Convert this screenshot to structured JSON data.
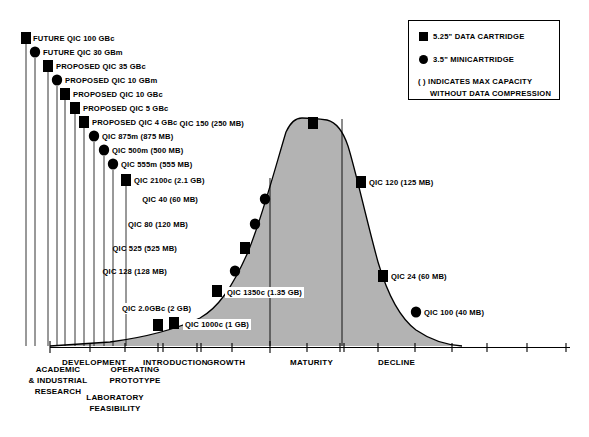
{
  "chart_data": {
    "type": "area",
    "xlabel": "",
    "ylabel": "",
    "grid": false,
    "legend_position": "top-right",
    "phases": [
      {
        "label": "DEVELOPMENT",
        "x": 62,
        "y": 358
      },
      {
        "label": "INTRODUCTION",
        "x": 143,
        "y": 358
      },
      {
        "label": "GROWTH",
        "x": 207,
        "y": 358
      },
      {
        "label": "MATURITY",
        "x": 290,
        "y": 358
      },
      {
        "label": "DECLINE",
        "x": 378,
        "y": 358
      }
    ],
    "sub_phases": [
      {
        "label": "ACADEMIC\n& INDUSTRIAL\nRESEARCH",
        "x": 12,
        "y": 370
      },
      {
        "label": "OPERATING\nPROTOTYPE",
        "x": 98,
        "y": 370
      },
      {
        "label": "LABORATORY\nFEASIBILITY",
        "x": 58,
        "y": 398
      }
    ],
    "curve_note": "Technology adoption S-curve / product life-cycle shaded area",
    "points": [
      {
        "name": "FUTURE QIC 100 GBc",
        "capacity": "100 GB",
        "marker": "square",
        "x": 26,
        "y": 38,
        "label": "FUTURE QIC 100 GBc",
        "lx": 33,
        "ly": 34
      },
      {
        "name": "FUTURE QIC 30 GBm",
        "capacity": "30 GB",
        "marker": "circle",
        "x": 35,
        "y": 52,
        "label": "FUTURE QIC 30 GBm",
        "lx": 43,
        "ly": 48
      },
      {
        "name": "PROPOSED QIC 35 GBc",
        "capacity": "35 GB",
        "marker": "square",
        "x": 48,
        "y": 66,
        "label": "PROPOSED QIC 35 GBc",
        "lx": 56,
        "ly": 62
      },
      {
        "name": "PROPOSED QIC 10 GBm",
        "capacity": "10 GB",
        "marker": "circle",
        "x": 57,
        "y": 80,
        "label": "PROPOSED QIC 10 GBm",
        "lx": 65,
        "ly": 76
      },
      {
        "name": "PROPOSED QIC 10 GBc",
        "capacity": "10 GB",
        "marker": "square",
        "x": 65,
        "y": 94,
        "label": "PROPOSED QIC 10 GBc",
        "lx": 73,
        "ly": 90
      },
      {
        "name": "PROPOSED QIC 5 GBc",
        "capacity": "5 GB",
        "marker": "square",
        "x": 75,
        "y": 108,
        "label": "PROPOSED QIC 5 GBc",
        "lx": 83,
        "ly": 104
      },
      {
        "name": "PROPOSED QIC 4 GBc",
        "capacity": "4 GB",
        "marker": "square",
        "x": 84,
        "y": 122,
        "label": "PROPOSED QIC 4 GBc",
        "lx": 92,
        "ly": 118
      },
      {
        "name": "QIC 875m",
        "capacity": "875 MB",
        "marker": "circle",
        "x": 94,
        "y": 136,
        "label": "QIC 875m (875 MB)",
        "lx": 102,
        "ly": 132
      },
      {
        "name": "QIC 500m",
        "capacity": "500 MB",
        "marker": "circle",
        "x": 104,
        "y": 150,
        "label": "QIC 500m (500 MB)",
        "lx": 112,
        "ly": 146
      },
      {
        "name": "QIC 555m",
        "capacity": "555 MB",
        "marker": "circle",
        "x": 113,
        "y": 164,
        "label": "QIC 555m (555 MB)",
        "lx": 121,
        "ly": 160
      },
      {
        "name": "QIC 2100c",
        "capacity": "2.1 GB",
        "marker": "square",
        "x": 126,
        "y": 180,
        "label": "QIC 2100c (2.1 GB)",
        "lx": 134,
        "ly": 176
      },
      {
        "name": "QIC 150",
        "capacity": "250 MB",
        "marker": "square",
        "x": 313,
        "y": 123,
        "label": "QIC 150 (250 MB)",
        "lx": 244,
        "ly": 119,
        "align": "right"
      },
      {
        "name": "QIC 120",
        "capacity": "125 MB",
        "marker": "square",
        "x": 361,
        "y": 182,
        "label": "QIC 120 (125 MB)",
        "lx": 369,
        "ly": 178
      },
      {
        "name": "QIC 40",
        "capacity": "60 MB",
        "marker": "circle",
        "x": 265,
        "y": 199,
        "label": "QIC 40 (60 MB)",
        "lx": 198,
        "ly": 195,
        "align": "right"
      },
      {
        "name": "QIC 80",
        "capacity": "120 MB",
        "marker": "circle",
        "x": 255,
        "y": 224,
        "label": "QIC 80 (120 MB)",
        "lx": 188,
        "ly": 220,
        "align": "right"
      },
      {
        "name": "QIC 525",
        "capacity": "525 MB",
        "marker": "square",
        "x": 245,
        "y": 248,
        "label": "QIC 525 (525 MB)",
        "lx": 177,
        "ly": 244,
        "align": "right"
      },
      {
        "name": "QIC 24",
        "capacity": "60 MB",
        "marker": "square",
        "x": 383,
        "y": 276,
        "label": "QIC 24 (60 MB)",
        "lx": 391,
        "ly": 272
      },
      {
        "name": "QIC 128",
        "capacity": "128 MB",
        "marker": "circle",
        "x": 235,
        "y": 271,
        "label": "QIC 128 (128 MB)",
        "lx": 167,
        "ly": 267,
        "align": "right"
      },
      {
        "name": "QIC 1350c",
        "capacity": "1.35 GB",
        "marker": "square",
        "x": 217,
        "y": 291,
        "label": "QIC 1350c (1.35 GB)",
        "lx": 225,
        "ly": 287,
        "boxed": true
      },
      {
        "name": "QIC 100",
        "capacity": "40 MB",
        "marker": "circle",
        "x": 416,
        "y": 312,
        "label": "QIC 100 (40 MB)",
        "lx": 424,
        "ly": 308
      },
      {
        "name": "QIC 2.0GBc",
        "capacity": "2 GB",
        "marker": "square",
        "x": 158,
        "y": 325,
        "label": "QIC 2.0GBc (2 GB)",
        "lx": 120,
        "ly": 303,
        "boxed": true
      },
      {
        "name": "QIC 1000c",
        "capacity": "1 GB",
        "marker": "square",
        "x": 174,
        "y": 323,
        "label": "QIC 1000c (1 GB)",
        "lx": 183,
        "ly": 319,
        "boxed": true
      }
    ]
  },
  "legend": {
    "items": [
      {
        "marker": "square",
        "label": "5.25\" DATA CARTRIDGE"
      },
      {
        "marker": "circle",
        "label": "3.5\" MINICARTRIDGE"
      }
    ],
    "note_line1": "( )  INDICATES MAX CAPACITY",
    "note_line2": "WITHOUT DATA COMPRESSION"
  },
  "axis": {
    "phases": [
      "DEVELOPMENT",
      "INTRODUCTION",
      "GROWTH",
      "MATURITY",
      "DECLINE"
    ],
    "sub_labels": [
      "ACADEMIC",
      "& INDUSTRIAL",
      "RESEARCH",
      "OPERATING",
      "PROTOTYPE",
      "LABORATORY",
      "FEASIBILITY"
    ]
  },
  "colors": {
    "area_fill": "#b3b3b3",
    "curve_stroke": "#000000",
    "marker": "#000000",
    "background": "#ffffff"
  }
}
